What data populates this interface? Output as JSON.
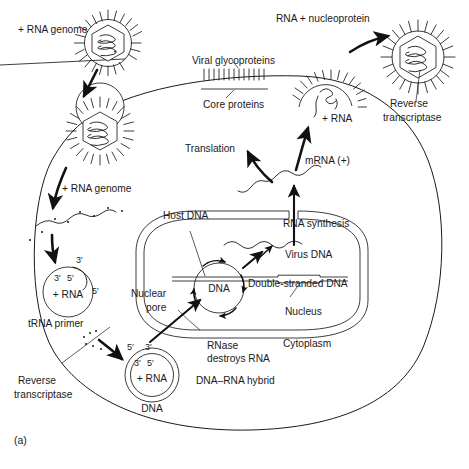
{
  "figure": {
    "panel_label": "(a)",
    "type": "retrovirus-replication-cycle-diagram"
  },
  "labels": {
    "rna_genome_top": "+ RNA genome",
    "rna_genome_mid": "+ RNA genome",
    "rna_nucleoprotein": "RNA + nucleoprotein",
    "reverse_transcriptase_right": "Reverse\ntranscriptase",
    "reverse_transcriptase_right_1": "Reverse",
    "reverse_transcriptase_right_2": "transcriptase",
    "viral_glycoproteins": "Viral glycoproteins",
    "core_proteins": "Core proteins",
    "translation": "Translation",
    "plus_rna_bud": "+ RNA",
    "mrna_plus": "mRNA (+)",
    "host_dna": "Host DNA",
    "rna_synthesis": "RNA synthesis",
    "virus_dna": "Virus DNA",
    "double_stranded_dna": "Double-stranded DNA",
    "dna_circle": "DNA",
    "nucleus": "Nucleus",
    "cytoplasm": "Cytoplasm",
    "nuclear_pore_1": "Nuclear",
    "nuclear_pore_2": "pore",
    "rnase_1": "RNase",
    "rnase_2": "destroys RNA",
    "dna_rna_hybrid": "DNA–RNA hybrid",
    "trna_primer": "tRNA primer",
    "reverse_transcriptase_left_1": "Reverse",
    "reverse_transcriptase_left_2": "transcriptase",
    "plus_rna_circle_upper": "+ RNA",
    "plus_rna_circle_lower": "+ RNA",
    "dna_lower_circle": "DNA",
    "primes": {
      "upper_circle_top": "3′",
      "upper_circle_inner_left": "3′",
      "upper_circle_inner_right": "5′",
      "upper_circle_right": "5′",
      "lower_circle_outer_left": "5′",
      "lower_circle_outer_right": "3′",
      "lower_circle_inner_left": "3′",
      "lower_circle_inner_right": "5′"
    }
  },
  "colors": {
    "ink": "#1a1a1a",
    "background": "#ffffff"
  }
}
